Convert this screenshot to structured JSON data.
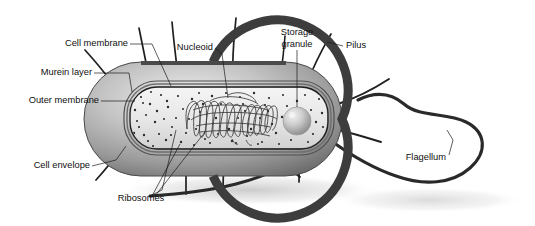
{
  "figure": {
    "background_color": "#ffffff",
    "ink_color": "#101010"
  },
  "labels": {
    "cell_membrane": "Cell membrane",
    "murein_layer": "Murein layer",
    "outer_membrane": "Outer membrane",
    "cell_envelope": "Cell envelope",
    "ribosomes": "Ribosomes",
    "nucleoid": "Nucleoid",
    "storage_granule_line1": "Storage",
    "storage_granule_line2": "granule",
    "pilus": "Pilus",
    "flagellum": "Flagellum"
  },
  "structures": {
    "cell_body": {
      "name": "rod-shaped bacterial cell",
      "fill": "#b0b0b0",
      "shape": "capsule"
    },
    "outer_membrane_ring": {
      "color": "#3a3a3a"
    },
    "murein_ring": {
      "color": "#6f6f6f"
    },
    "cell_membrane_ring": {
      "color": "#2b2b2b"
    },
    "cytoplasm": {
      "color": "#ececec"
    },
    "ribosome_dots": {
      "color": "#2a2a2a",
      "count": 230
    },
    "nucleoid_dna": {
      "color": "#3a3a3a"
    },
    "storage_granule": {
      "color": "#c9c9c9"
    },
    "pili": {
      "color": "#1f1f1f",
      "count": 9
    },
    "flagellum_filament": {
      "color": "#2a2a2a"
    },
    "drop_shadow": {
      "color": "#d8d8d8"
    }
  }
}
